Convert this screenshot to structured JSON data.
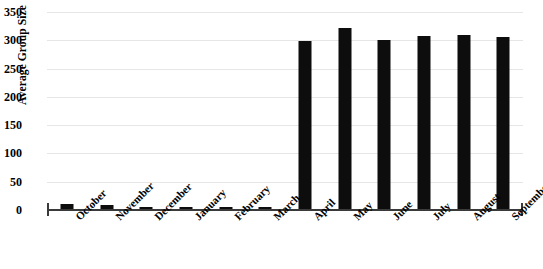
{
  "chart_data": {
    "type": "bar",
    "title": "",
    "xlabel": "",
    "ylabel": "Average Group Size",
    "ylim": [
      0,
      350
    ],
    "yticks": [
      0,
      50,
      100,
      150,
      200,
      250,
      300,
      350
    ],
    "grid": true,
    "legend": null,
    "bar_color": "#0d0d0d",
    "gridline_color": "#e6e6e6",
    "axis_color": "#3a3a3a",
    "categories": [
      "October",
      "November",
      "December",
      "January",
      "February",
      "March",
      "April",
      "May",
      "June",
      "July",
      "August",
      "September"
    ],
    "values": [
      10,
      8,
      6,
      6,
      5,
      5,
      298,
      322,
      300,
      307,
      309,
      306
    ]
  }
}
